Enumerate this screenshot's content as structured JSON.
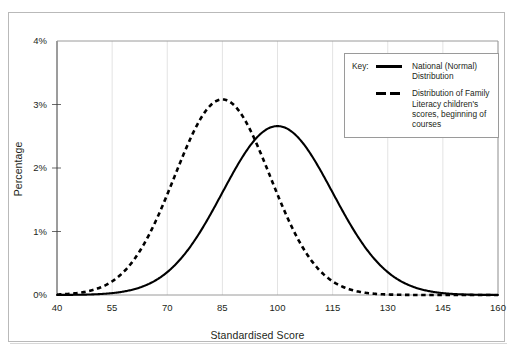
{
  "chart_data": {
    "type": "line",
    "title": "",
    "xlabel": "Standardised Score",
    "ylabel": "Percentage",
    "xlim": [
      40,
      160
    ],
    "ylim": [
      0,
      4
    ],
    "xticks": [
      40,
      55,
      70,
      85,
      100,
      115,
      130,
      145,
      160
    ],
    "xtick_labels": [
      "40",
      "55",
      "70",
      "85",
      "100",
      "115",
      "130",
      "145",
      "160"
    ],
    "yticks": [
      0,
      1,
      2,
      3,
      4
    ],
    "ytick_labels": [
      "0%",
      "1%",
      "2%",
      "3%",
      "4%"
    ],
    "grid": "vertical-only",
    "legend_position": "top-right-inside",
    "series": [
      {
        "name": "National (Normal) Distribution",
        "style": "solid",
        "color": "#000000",
        "mean": 100,
        "sd": 15,
        "peak_value": 2.66,
        "x": [
          40,
          45,
          50,
          55,
          60,
          65,
          70,
          75,
          80,
          85,
          90,
          95,
          100,
          105,
          110,
          115,
          120,
          125,
          130,
          135,
          140,
          145,
          150,
          155,
          160
        ],
        "values": [
          0.01,
          0.03,
          0.07,
          0.13,
          0.23,
          0.39,
          0.61,
          0.91,
          1.29,
          1.72,
          2.15,
          2.52,
          2.66,
          2.52,
          2.15,
          1.72,
          1.29,
          0.91,
          0.61,
          0.39,
          0.23,
          0.13,
          0.07,
          0.03,
          0.01
        ]
      },
      {
        "name": "Distribution of Family Literacy children's scores, beginning of courses",
        "style": "dashed",
        "color": "#000000",
        "mean": 85,
        "sd": 13,
        "peak_value": 3.08,
        "x": [
          40,
          45,
          50,
          55,
          60,
          65,
          70,
          75,
          80,
          85,
          90,
          95,
          100,
          105,
          110,
          115,
          120,
          125,
          130,
          135,
          140,
          145,
          150,
          155,
          160
        ],
        "values": [
          0.02,
          0.07,
          0.19,
          0.44,
          0.89,
          1.55,
          2.31,
          2.93,
          3.08,
          3.08,
          2.93,
          2.31,
          1.55,
          0.89,
          0.44,
          0.19,
          0.07,
          0.02,
          0.01,
          0.0,
          0.0,
          0.0,
          0.0,
          0.0,
          0.0
        ]
      }
    ]
  },
  "legend": {
    "key_label": "Key:",
    "entries": [
      {
        "swatch": "solid-line-swatch",
        "text": "National (Normal) Distribution"
      },
      {
        "swatch": "dashed-line-swatch",
        "text": "Distribution of Family Literacy children's scores, beginning of courses"
      }
    ]
  },
  "colors": {
    "line": "#000000",
    "axis": "#3a3a3a",
    "grid": "#e3e3e3",
    "frame": "#b9b9b9",
    "legend_border": "#9a9a9a",
    "text": "#231f20"
  }
}
